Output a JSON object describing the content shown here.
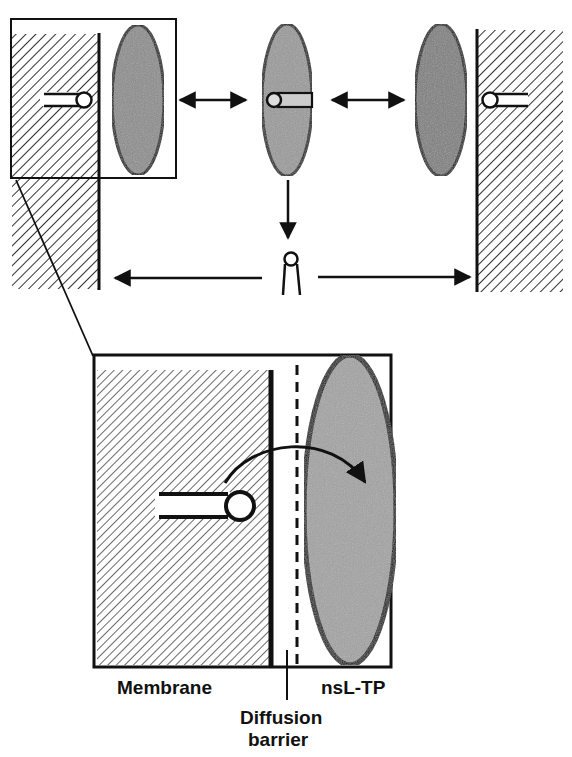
{
  "figure": {
    "type": "schematic diagram",
    "colors": {
      "ink": "#111111",
      "protein_fill": "#8a8a8a",
      "protein_fill_light": "#b0b0b0",
      "hatch": "#333333",
      "background": "#ffffff"
    },
    "top_panel": {
      "left_membrane": "hatched membrane with embedded lipid (left)",
      "right_membrane": "hatched membrane with embedded lipid (right)",
      "proteins": [
        "nsL-TP near left membrane",
        "nsL-TP carrying lipid (center)",
        "nsL-TP near right membrane"
      ],
      "arrows": [
        "double arrow left-center",
        "double arrow center-right",
        "down arrow from center protein",
        "left arrow to left membrane",
        "right arrow to right membrane"
      ],
      "free_lipid": "free lipid monomer (center)"
    },
    "inset": {
      "description": "magnified view of membrane/nsL-TP interface",
      "curved_arrow": "lipid transfer across diffusion barrier into nsL-TP"
    },
    "labels": {
      "membrane": "Membrane",
      "nsltp": "nsL-TP",
      "diffusion_line1": "Diffusion",
      "diffusion_line2": "barrier"
    }
  }
}
